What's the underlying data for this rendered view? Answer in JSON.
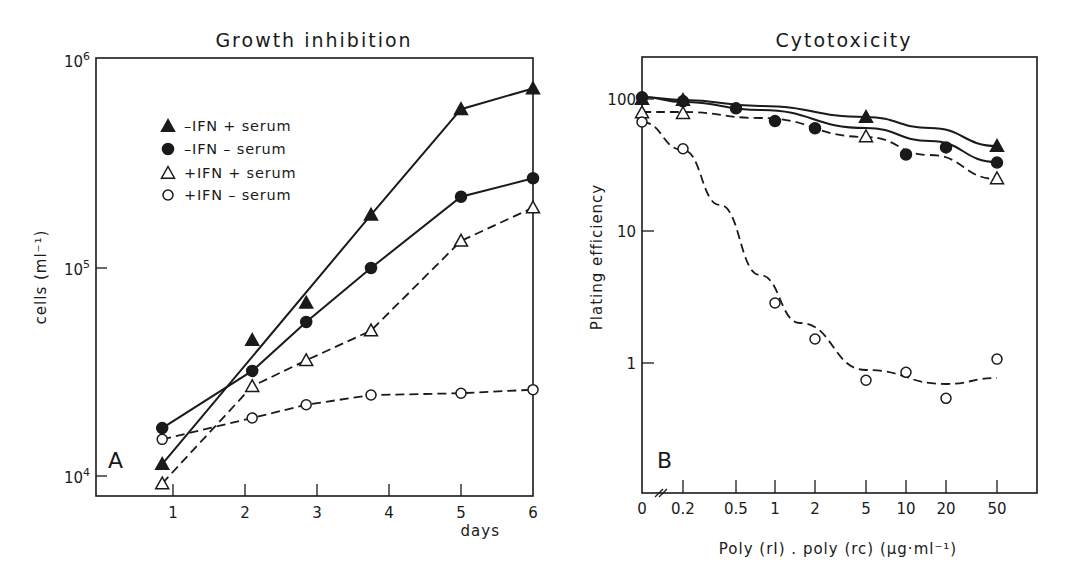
{
  "chart_data": [
    {
      "type": "line",
      "panel_label": "A",
      "title": "Growth inhibition",
      "xlabel": "days",
      "ylabel": "cells (ml⁻¹)",
      "xscale": "linear",
      "yscale": "log",
      "xlim": [
        -0.07,
        6
      ],
      "ylim": [
        8000,
        1000000
      ],
      "x_ticks": [
        1,
        2,
        3,
        4,
        5,
        6
      ],
      "y_ticks": [
        {
          "value": 10000,
          "label_base": "10",
          "label_exp": "4"
        },
        {
          "value": 100000,
          "label_base": "10",
          "label_exp": "5"
        },
        {
          "value": 1000000,
          "label_base": "10",
          "label_exp": "6"
        }
      ],
      "legend_position": "upper-left",
      "series": [
        {
          "name": "-IFN + serum",
          "legend_label": "–IFN + serum",
          "marker": "filled-triangle",
          "line": "solid",
          "x": [
            0.85,
            2.1,
            2.85,
            3.75,
            5,
            6
          ],
          "y": [
            11400,
            45000,
            68000,
            180000,
            580000,
            730000
          ],
          "fit_points": [
            [
              0.85,
              11400
            ],
            [
              3.75,
              180000
            ],
            [
              5,
              580000
            ],
            [
              6,
              730000
            ]
          ]
        },
        {
          "name": "-IFN - serum",
          "legend_label": "–IFN – serum",
          "marker": "filled-circle",
          "line": "solid",
          "x": [
            0.85,
            2.1,
            2.85,
            3.75,
            5,
            6
          ],
          "y": [
            17000,
            32000,
            55000,
            100000,
            220000,
            270000
          ]
        },
        {
          "name": "+IFN + serum",
          "legend_label": "+IFN + serum",
          "marker": "open-triangle",
          "line": "dashed",
          "x": [
            0.85,
            2.1,
            2.85,
            3.75,
            5,
            6
          ],
          "y": [
            9200,
            27000,
            36000,
            50000,
            135000,
            195000
          ]
        },
        {
          "name": "+IFN - serum",
          "legend_label": "+IFN – serum",
          "marker": "open-circle",
          "line": "dashed",
          "x": [
            0.85,
            2.1,
            2.85,
            3.75,
            5,
            6
          ],
          "y": [
            15000,
            19000,
            22000,
            24500,
            25000,
            26000
          ]
        }
      ]
    },
    {
      "type": "line",
      "panel_label": "B",
      "title": "Cytotoxicity",
      "xlabel": "Poly (rI) . poly (rc)  (µg·ml⁻¹)",
      "ylabel": "Plating efficiency",
      "xscale": "categorical-log",
      "yscale": "log",
      "ylim": [
        0.1,
        200
      ],
      "x_ticks": [
        "0",
        "0.2",
        "0.5",
        "1",
        "2",
        "5",
        "10",
        "20",
        "50"
      ],
      "axis_break": "between 0 and 0.2",
      "y_ticks": [
        {
          "value": 1,
          "label": "1"
        },
        {
          "value": 10,
          "label": "10"
        },
        {
          "value": 100,
          "label": "100"
        }
      ],
      "series": [
        {
          "name": "-IFN + serum",
          "marker": "filled-triangle",
          "line": "solid-fit",
          "x": [
            "0",
            "0.2",
            "5",
            "50"
          ],
          "y": [
            100,
            98,
            73,
            44
          ]
        },
        {
          "name": "-IFN - serum",
          "marker": "filled-circle",
          "line": "solid-fit",
          "x": [
            "0",
            "0.2",
            "0.5",
            "1",
            "2",
            "10",
            "20",
            "50"
          ],
          "y": [
            103,
            96,
            85,
            68,
            60,
            38,
            43,
            33
          ]
        },
        {
          "name": "+IFN + serum",
          "marker": "open-triangle",
          "line": "dashed-fit",
          "x": [
            "0",
            "0.2",
            "5",
            "50"
          ],
          "y": [
            79,
            78,
            52,
            25
          ]
        },
        {
          "name": "+IFN - serum",
          "marker": "open-circle",
          "line": "dashed-fit",
          "x": [
            "0",
            "0.2",
            "1",
            "2",
            "5",
            "10",
            "20",
            "50"
          ],
          "y": [
            67,
            42,
            2.85,
            1.52,
            0.74,
            0.85,
            0.54,
            1.07
          ]
        }
      ]
    }
  ],
  "layout": {
    "A": {
      "left": 96,
      "right": 533,
      "top": 58,
      "bottom": 496,
      "x_px": {
        "1": 173,
        "per_day": 72
      },
      "y_px": {
        "1e4": 476,
        "per_decade": 208
      }
    },
    "B": {
      "left": 642,
      "right": 1037,
      "top": 57,
      "bottom": 493,
      "x_px": {
        "0": 642,
        "0.2": 683,
        "0.5": 736,
        "1": 775,
        "2": 815,
        "5": 866,
        "10": 906,
        "20": 946,
        "50": 997
      },
      "y_px": {
        "1": 363,
        "per_decade": 132
      }
    }
  },
  "curves_B": {
    "-IFN + serum": [
      [
        642,
        97
      ],
      [
        683,
        100
      ],
      [
        760,
        106
      ],
      [
        866,
        117
      ],
      [
        930,
        128
      ],
      [
        997,
        146
      ]
    ],
    "-IFN - serum": [
      [
        642,
        97
      ],
      [
        683,
        102
      ],
      [
        760,
        110
      ],
      [
        866,
        128
      ],
      [
        930,
        141
      ],
      [
        997,
        162
      ]
    ],
    "+IFN + serum": [
      [
        642,
        112
      ],
      [
        683,
        112
      ],
      [
        760,
        118
      ],
      [
        866,
        137
      ],
      [
        930,
        155
      ],
      [
        997,
        179
      ]
    ],
    "+IFN - serum": [
      [
        642,
        122
      ],
      [
        683,
        150
      ],
      [
        720,
        205
      ],
      [
        760,
        275
      ],
      [
        800,
        323
      ],
      [
        866,
        370
      ],
      [
        946,
        384
      ],
      [
        997,
        378
      ]
    ]
  }
}
